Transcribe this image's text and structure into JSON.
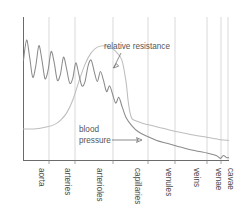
{
  "chart_data": {
    "type": "line",
    "title": "",
    "xlabel": "",
    "ylabel": "",
    "grid": true,
    "legend_position": "inline-annotations",
    "categories": [
      "aorta",
      "arteries",
      "arterioles",
      "capillaries",
      "venules",
      "veins",
      "venae cavae"
    ],
    "xlim": [
      0,
      100
    ],
    "ylim": [
      0,
      100
    ],
    "series": [
      {
        "name": "blood pressure",
        "color": "#8b8b8b",
        "description": "Pulsatile pressure oscillating with high amplitude in aorta and arteries, damping through arterioles, falling steeply and flattening to near zero in venules, veins and venae cavae",
        "x": [
          0,
          1.5,
          3,
          4.5,
          6,
          7.5,
          9,
          10.5,
          12,
          13.5,
          15,
          16.5,
          18,
          19.5,
          21,
          22.5,
          24,
          25.5,
          27,
          28.5,
          30,
          31.5,
          33,
          34.5,
          36,
          37.5,
          39,
          40.5,
          42,
          43.5,
          45,
          46.5,
          48,
          50,
          53,
          56,
          60,
          65,
          70,
          75,
          80,
          85,
          90,
          94,
          96,
          97.5,
          99,
          100
        ],
        "y": [
          70,
          84,
          72,
          58,
          66,
          80,
          70,
          57,
          63,
          76,
          68,
          56,
          60,
          72,
          64,
          54,
          57,
          68,
          60,
          52,
          55,
          66,
          70,
          62,
          55,
          62,
          56,
          48,
          52,
          46,
          40,
          44,
          38,
          30,
          24,
          20,
          17,
          14,
          12,
          10,
          8,
          6.5,
          5,
          3.5,
          1.5,
          3.5,
          2,
          2
        ]
      },
      {
        "name": "relative resistance",
        "color": "#bdbdbd",
        "description": "Low and flat in aorta and arteries, rising steeply through arterioles to a broad peak, then dropping sharply at the capillaries and declining gently through venules, veins and venae cavae",
        "x": [
          0,
          5,
          10,
          15,
          18,
          21,
          24,
          27,
          30,
          33,
          36,
          39,
          42,
          45,
          48,
          50,
          51,
          52,
          53,
          55,
          58,
          62,
          68,
          75,
          82,
          90,
          96,
          100
        ],
        "y": [
          22,
          22,
          23,
          25,
          28,
          33,
          42,
          55,
          67,
          75,
          79,
          80,
          79,
          76,
          70,
          55,
          42,
          33,
          29,
          27.5,
          26,
          24.5,
          22.5,
          20,
          18,
          16,
          14.5,
          14
        ]
      }
    ],
    "annotations": [
      {
        "id": "relative-resistance-label",
        "text": "relative resistance",
        "lines": [
          "relative resistance"
        ],
        "target_x": 50,
        "target_y": 72
      },
      {
        "id": "blood-pressure-label",
        "text": "blood pressure",
        "lines": [
          "blood",
          "pressure"
        ],
        "target_x": 58,
        "target_y": 19
      }
    ],
    "axis_color": "#6b6b6b",
    "gridline_color": "#cfcfcf",
    "background_color": "#ffffff"
  },
  "axis": {
    "category_labels": [
      "aorta",
      "arteries",
      "arterioles",
      "capillaries",
      "venules",
      "veins",
      "venae",
      "cavae"
    ]
  },
  "labels": {
    "relative_resistance": "relative resistance",
    "blood_line1": "blood",
    "blood_line2": "pressure"
  }
}
